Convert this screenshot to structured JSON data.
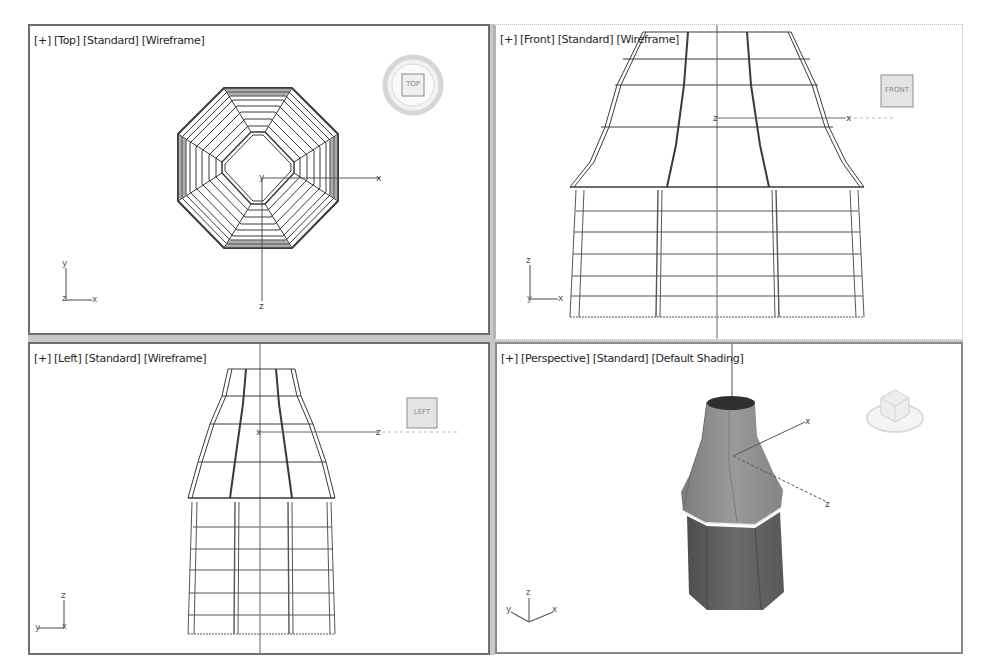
{
  "app": {
    "name": "3D modeling viewports"
  },
  "viewports": [
    {
      "id": "top",
      "label_parts": [
        "[+]",
        "[Top]",
        "[Standard]",
        "[Wireframe]"
      ],
      "viewcube_label": "TOP",
      "tripod_axes": [
        "y",
        "z",
        "x"
      ],
      "gizmo_axes": [
        "y",
        "x",
        "z"
      ]
    },
    {
      "id": "front",
      "label_parts": [
        "[+]",
        "[Front]",
        "[Standard]",
        "[Wireframe]"
      ],
      "viewcube_label": "FRONT",
      "tripod_axes": [
        "z",
        "y",
        "x"
      ],
      "gizmo_axes": [
        "z",
        "x"
      ]
    },
    {
      "id": "left",
      "label_parts": [
        "[+]",
        "[Left]",
        "[Standard]",
        "[Wireframe]"
      ],
      "viewcube_label": "LEFT",
      "tripod_axes": [
        "z",
        "y",
        "x"
      ],
      "gizmo_axes": [
        "x",
        "z"
      ]
    },
    {
      "id": "perspective",
      "label_parts": [
        "[+]",
        "[Perspective]",
        "[Standard]",
        "[Default Shading]"
      ],
      "viewcube_label": "",
      "tripod_axes": [
        "y",
        "z",
        "x"
      ],
      "gizmo_axes": [
        "x",
        "z"
      ]
    }
  ],
  "colors": {
    "wire": "#3a3a3a",
    "wire_light": "#8c8c8c",
    "shade_top": "#8a8a8a",
    "shade_bottom": "#5e5e5e",
    "border_active": "#6e6e6e",
    "gutter": "#c8c8c8"
  }
}
